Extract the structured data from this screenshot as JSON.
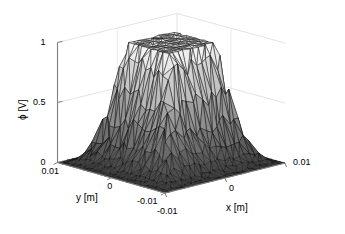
{
  "figure": {
    "background_color": "#ffffff",
    "mesh_edge_color": "#000000",
    "grid_color": "#dcdcdc",
    "axis_color": "#808080"
  },
  "axes": {
    "z": {
      "label": "ϕ [V]",
      "ticks": [
        "0",
        "0.5",
        "1"
      ],
      "values": [
        0,
        0.5,
        1
      ]
    },
    "y": {
      "label": "y [m]",
      "ticks": [
        "0.01",
        "0",
        "-0.01"
      ],
      "values": [
        0.01,
        0,
        -0.01
      ]
    },
    "x": {
      "label": "x [m]",
      "ticks": [
        "-0.01",
        "0",
        "0.01"
      ],
      "values": [
        -0.01,
        0,
        0.01
      ]
    }
  },
  "chart_data": {
    "type": "surface",
    "title": "",
    "xlabel": "x [m]",
    "ylabel": "y [m]",
    "zlabel": "ϕ [V]",
    "xlim": [
      -0.01,
      0.01
    ],
    "ylim": [
      -0.01,
      0.01
    ],
    "zlim": [
      0,
      1
    ],
    "xticks": [
      -0.01,
      0,
      0.01
    ],
    "yticks": [
      -0.01,
      0,
      0.01
    ],
    "zticks": [
      0,
      0.5,
      1
    ],
    "grid": true,
    "legend": null,
    "colormap": "gray",
    "shading": "faceted",
    "mesh": "triangular-irregular",
    "view_azimuth": -37.5,
    "view_elevation": 30,
    "plateau_value": 1.0,
    "boundary_value": 0.0,
    "plateau_half_width": 0.004,
    "domain_half_width": 0.01,
    "grid_n": 25,
    "z_min_observed": 0.0,
    "z_max_observed": 1.0
  }
}
